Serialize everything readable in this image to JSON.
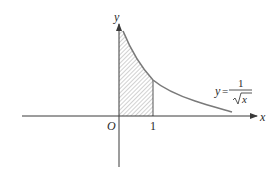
{
  "diagram": {
    "type": "function-graph",
    "function_label": {
      "lhs": "y=",
      "numerator": "1",
      "denominator_radicand": "x",
      "text": "y=1/√x"
    },
    "axes": {
      "x_label": "x",
      "y_label": "y",
      "origin_label": "O"
    },
    "ticks": [
      {
        "value": 1,
        "label": "1"
      }
    ],
    "shaded_region": {
      "description": "area under y=1/√x from x=0 to x=1",
      "x_from": 0,
      "x_to": 1,
      "fill": "hatched"
    },
    "colors": {
      "axes": "#3a3a3a",
      "curve": "#7a7a7a",
      "hatch": "#9a9a9a",
      "text": "#2a2a2a"
    }
  }
}
